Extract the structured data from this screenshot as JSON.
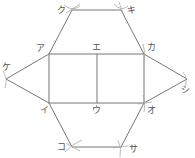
{
  "diagram": {
    "stroke_color": "#777777",
    "arc_color": "#999999",
    "points": {
      "a": {
        "label": "ア",
        "x": 49,
        "y": 54
      },
      "i": {
        "label": "イ",
        "x": 49,
        "y": 103
      },
      "u": {
        "label": "ウ",
        "x": 97,
        "y": 103
      },
      "e": {
        "label": "エ",
        "x": 97,
        "y": 54
      },
      "o": {
        "label": "オ",
        "x": 144,
        "y": 103
      },
      "ka": {
        "label": "カ",
        "x": 144,
        "y": 54
      },
      "ki": {
        "label": "キ",
        "x": 121,
        "y": 10
      },
      "ku": {
        "label": "ク",
        "x": 72,
        "y": 10
      },
      "ke": {
        "label": "ケ",
        "x": 6,
        "y": 79
      },
      "ko": {
        "label": "コ",
        "x": 72,
        "y": 147
      },
      "sa": {
        "label": "サ",
        "x": 121,
        "y": 147
      },
      "shi": {
        "label": "シ",
        "x": 187,
        "y": 79
      }
    }
  }
}
